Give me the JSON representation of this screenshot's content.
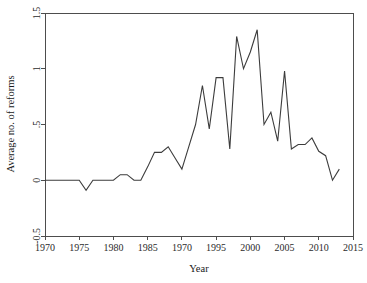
{
  "chart_data": {
    "type": "line",
    "title": "",
    "xlabel": "Year",
    "ylabel": "Average no. of reforms",
    "xlim": [
      1970,
      2015
    ],
    "ylim": [
      -0.5,
      1.5
    ],
    "grid": false,
    "legend": null,
    "xticks": [
      1970,
      1975,
      1980,
      1985,
      1970,
      1995,
      2000,
      2005,
      2010,
      2015
    ],
    "xtick_labels": [
      "1970",
      "1975",
      "1980",
      "1985",
      "1970",
      "1995",
      "2000",
      "2005",
      "2010",
      "2015"
    ],
    "xtick_positions": [
      1970,
      1975,
      1980,
      1985,
      1990,
      1995,
      2000,
      2005,
      2010,
      2015
    ],
    "yticks": [
      -0.5,
      0,
      0.5,
      1,
      1.5
    ],
    "ytick_labels": [
      "-0.5",
      "0",
      ".5",
      "1",
      "1.5"
    ],
    "series": [
      {
        "name": "Average no. of reforms",
        "color": "#3c3c3c",
        "x": [
          1970,
          1971,
          1972,
          1973,
          1974,
          1975,
          1976,
          1977,
          1978,
          1979,
          1980,
          1981,
          1982,
          1983,
          1984,
          1985,
          1986,
          1987,
          1988,
          1989,
          1990,
          1991,
          1992,
          1993,
          1994,
          1995,
          1996,
          1997,
          1998,
          1999,
          2000,
          2001,
          2002,
          2003,
          2004,
          2005,
          2006,
          2007,
          2008,
          2009,
          2010,
          2011,
          2012,
          2013
        ],
        "values": [
          0.0,
          0.0,
          0.0,
          0.0,
          0.0,
          0.0,
          -0.09,
          0.0,
          0.0,
          0.0,
          0.0,
          0.05,
          0.05,
          0.0,
          0.0,
          0.12,
          0.25,
          0.25,
          0.3,
          0.2,
          0.1,
          0.3,
          0.5,
          0.85,
          0.46,
          0.92,
          0.92,
          0.28,
          1.29,
          1.0,
          1.15,
          1.35,
          0.5,
          0.61,
          0.35,
          0.98,
          0.28,
          0.32,
          0.32,
          0.38,
          0.26,
          0.22,
          0.0,
          0.1
        ]
      }
    ]
  },
  "axes": {
    "y_title": "Average no. of reforms",
    "x_title": "Year"
  }
}
